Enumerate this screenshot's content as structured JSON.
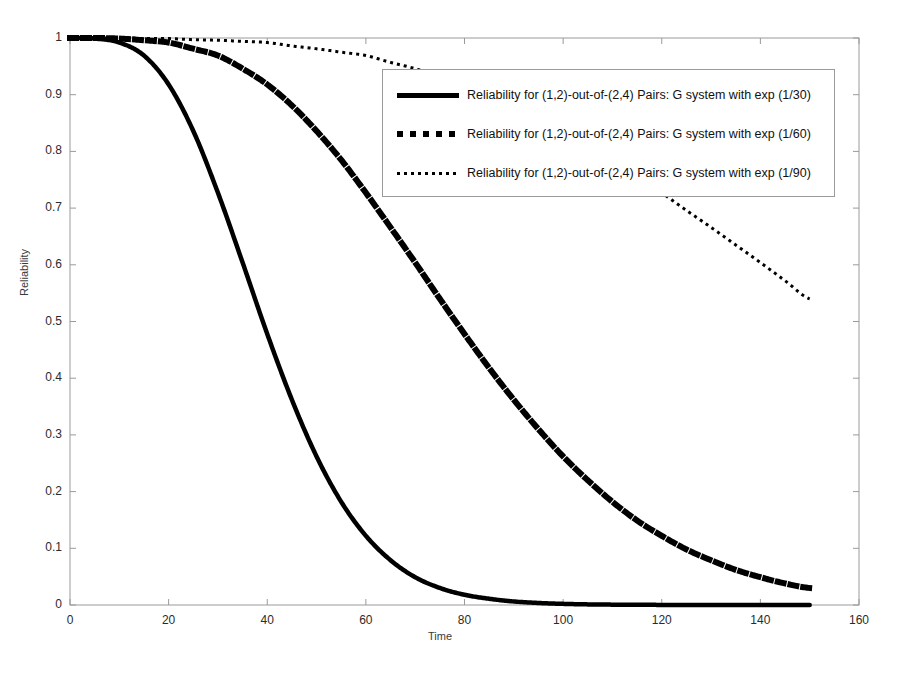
{
  "chart_data": {
    "type": "line",
    "title": "",
    "xlabel": "Time",
    "ylabel": "Reliability",
    "xlim": [
      0,
      160
    ],
    "ylim": [
      0,
      1
    ],
    "xticks": [
      0,
      20,
      40,
      60,
      80,
      100,
      120,
      140,
      160
    ],
    "yticks": [
      0,
      0.1,
      0.2,
      0.3,
      0.4,
      0.5,
      0.6,
      0.7,
      0.8,
      0.9,
      1
    ],
    "grid": false,
    "legend_position": "upper right",
    "x": [
      0,
      5,
      10,
      15,
      20,
      25,
      30,
      35,
      40,
      45,
      50,
      55,
      60,
      65,
      70,
      75,
      80,
      85,
      90,
      95,
      100,
      105,
      110,
      115,
      120,
      125,
      130,
      135,
      140,
      145,
      150
    ],
    "series": [
      {
        "name": "Reliability for (1,2)-out-of-(2,4) Pairs: G system with exp (1/30)",
        "style": "solid",
        "linewidth": 4.5,
        "color": "#000000",
        "rate": "1/30",
        "values": [
          1.0,
          0.999,
          0.992,
          0.969,
          0.918,
          0.836,
          0.727,
          0.604,
          0.478,
          0.362,
          0.262,
          0.182,
          0.122,
          0.079,
          0.049,
          0.03,
          0.018,
          0.011,
          0.0062,
          0.0036,
          0.002,
          0.0011,
          0.00063,
          0.00035,
          0.00019,
          0.0001,
          5.7e-05,
          3.1e-05,
          1.7e-05,
          9.2e-06,
          5e-06
        ]
      },
      {
        "name": "Reliability for (1,2)-out-of-(2,4) Pairs: G system with exp (1/60)",
        "style": "dashed",
        "linewidth": 6,
        "color": "#000000",
        "rate": "1/60",
        "values": [
          1.0,
          1.0,
          0.999,
          0.996,
          0.992,
          0.981,
          0.969,
          0.946,
          0.918,
          0.881,
          0.836,
          0.785,
          0.727,
          0.666,
          0.604,
          0.54,
          0.478,
          0.418,
          0.362,
          0.31,
          0.262,
          0.22,
          0.182,
          0.149,
          0.122,
          0.098,
          0.079,
          0.062,
          0.049,
          0.038,
          0.03
        ]
      },
      {
        "name": "Reliability for (1,2)-out-of-(2,4) Pairs: G system with exp (1/90)",
        "style": "dotted",
        "linewidth": 3,
        "color": "#000000",
        "rate": "1/90",
        "values": [
          1.0,
          1.0,
          1.0,
          0.999,
          0.999,
          0.997,
          0.996,
          0.994,
          0.992,
          0.986,
          0.981,
          0.975,
          0.969,
          0.957,
          0.946,
          0.932,
          0.918,
          0.899,
          0.881,
          0.859,
          0.836,
          0.811,
          0.785,
          0.757,
          0.727,
          0.696,
          0.666,
          0.635,
          0.604,
          0.572,
          0.54
        ]
      }
    ]
  },
  "legend": {
    "items": [
      {
        "label": "Reliability for (1,2)-out-of-(2,4) Pairs: G system with exp (1/30)",
        "style": "solid"
      },
      {
        "label": "Reliability for (1,2)-out-of-(2,4) Pairs: G system with exp (1/60)",
        "style": "dashed"
      },
      {
        "label": "Reliability for (1,2)-out-of-(2,4) Pairs: G system with exp (1/90)",
        "style": "dotted"
      }
    ]
  },
  "axes": {
    "x_label": "Time",
    "y_label": "Reliability",
    "x_tick_labels": [
      "0",
      "20",
      "40",
      "60",
      "80",
      "100",
      "120",
      "140",
      "160"
    ],
    "y_tick_labels": [
      "0",
      "0.1",
      "0.2",
      "0.3",
      "0.4",
      "0.5",
      "0.6",
      "0.7",
      "0.8",
      "0.9",
      "1"
    ]
  },
  "colors": {
    "background": "#ffffff",
    "axis": "#9a9a9a",
    "curve": "#000000",
    "tick_text": "#2b2b2b"
  }
}
